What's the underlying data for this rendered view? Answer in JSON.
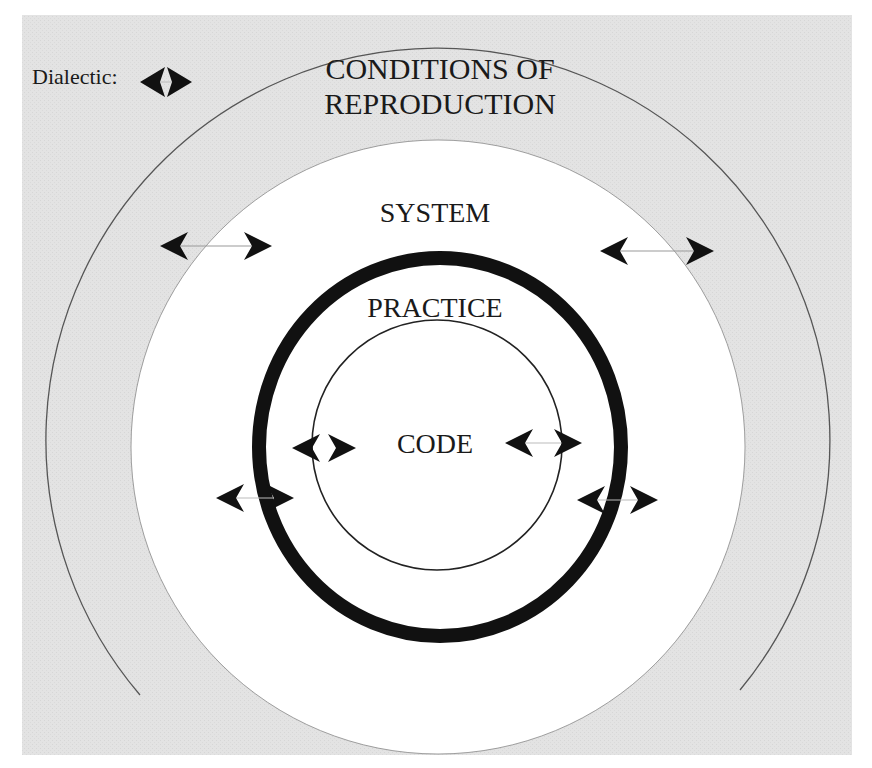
{
  "diagram": {
    "legend": {
      "label": "Dialectic:",
      "icon": "dialectic-double-arrow-icon"
    },
    "layers": [
      {
        "id": "conditions",
        "label": "CONDITIONS OF REPRODUCTION",
        "line1": "CONDITIONS OF",
        "line2": "REPRODUCTION",
        "fill": "#e3e3e3"
      },
      {
        "id": "system",
        "label": "SYSTEM",
        "fill": "#ffffff"
      },
      {
        "id": "practice",
        "label": "PRACTICE",
        "ring": "thick",
        "stroke": "#111111"
      },
      {
        "id": "code",
        "label": "CODE",
        "ring": "thin",
        "stroke": "#222222"
      }
    ],
    "dialectic_arrows": [
      {
        "between": [
          "conditions",
          "system"
        ],
        "side": "left"
      },
      {
        "between": [
          "system",
          "conditions"
        ],
        "side": "right"
      },
      {
        "between": [
          "system",
          "practice"
        ],
        "side": "left"
      },
      {
        "between": [
          "practice",
          "system"
        ],
        "side": "right"
      },
      {
        "between": [
          "practice",
          "code"
        ],
        "side": "left"
      },
      {
        "between": [
          "code",
          "practice"
        ],
        "side": "right"
      }
    ],
    "colors": {
      "background_gray": "#e3e3e3",
      "ink": "#111111",
      "thin_line": "#555555",
      "white": "#ffffff"
    }
  }
}
